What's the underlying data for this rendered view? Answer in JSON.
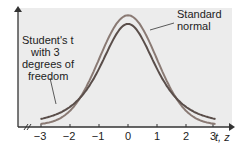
{
  "chart_data": {
    "type": "line",
    "title": "",
    "xlabel": "t, z",
    "ylabel": "",
    "x_ticks": [
      "-3",
      "-2",
      "-1",
      "0",
      "1",
      "2",
      "3"
    ],
    "xlim": [
      -3.2,
      3.2
    ],
    "grid": false,
    "series": [
      {
        "name": "Standard normal",
        "color": "#8a7a74",
        "peak": 0.399,
        "distribution": "N(0,1)"
      },
      {
        "name": "Student's t with 3 degrees of freedom",
        "color": "#5a4e4a",
        "peak": 0.368,
        "distribution": "t(3)"
      }
    ],
    "annotations": [
      {
        "text": "Standard normal",
        "target": "normal curve near peak"
      },
      {
        "text": "Student's t with 3 degrees of freedom",
        "target": "t curve left tail"
      }
    ]
  },
  "labels": {
    "normal_line1": "Standard",
    "normal_line2": "normal",
    "t_line1": "Student's t",
    "t_line2": "with 3",
    "t_line3": "degrees of",
    "t_line4": "freedom",
    "axis": "t, z"
  },
  "ticks": [
    "−3",
    "−2",
    "−1",
    "0",
    "1",
    "2",
    "3"
  ]
}
